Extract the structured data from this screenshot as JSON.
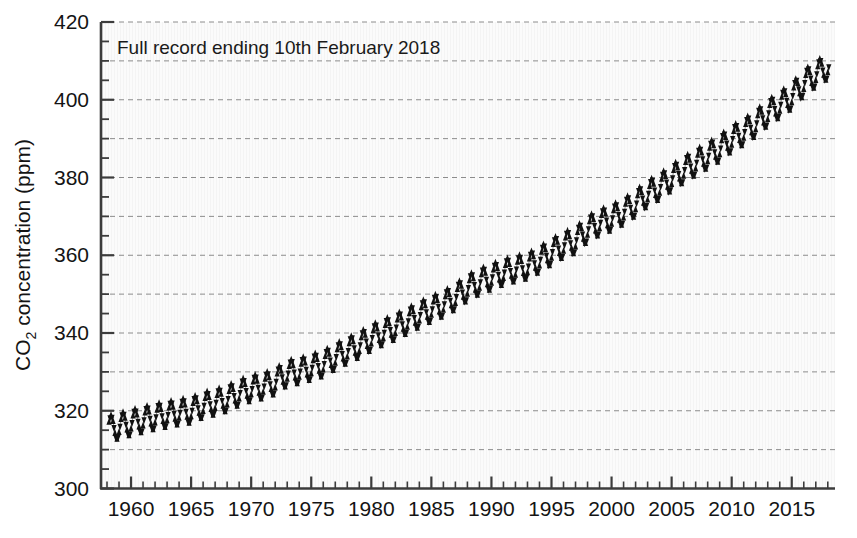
{
  "figure": {
    "background_color": "#ffffff",
    "plot_background_color": "#fbfbfb",
    "axis_color": "#3c3c3c",
    "grid_color": "#8c8c8c",
    "marker_color": "#111111"
  },
  "chart_data": {
    "type": "line",
    "title": "",
    "annotation": "Full record ending 10th February 2018",
    "xlabel": "",
    "ylabel_parts": {
      "pre": "CO",
      "sub": "2",
      "post": " concentration (ppm)"
    },
    "ylabel": "CO2 concentration (ppm)",
    "xlim": [
      1957.5,
      2018.6
    ],
    "ylim": [
      300,
      420
    ],
    "xticks_major": [
      1960,
      1965,
      1970,
      1975,
      1980,
      1985,
      1990,
      1995,
      2000,
      2005,
      2010,
      2015
    ],
    "xtick_labels": [
      "1960",
      "1965",
      "1970",
      "1975",
      "1980",
      "1985",
      "1990",
      "1995",
      "2000",
      "2005",
      "2010",
      "2015"
    ],
    "xtick_minor_step": 1,
    "yticks_major": [
      300,
      320,
      340,
      360,
      380,
      400,
      420
    ],
    "ytick_labels": [
      "300",
      "320",
      "340",
      "360",
      "380",
      "400",
      "420"
    ],
    "ytick_minor_step": 5,
    "gridlines_y": [
      310,
      320,
      330,
      340,
      350,
      360,
      370,
      380,
      390,
      400,
      410,
      420
    ],
    "grid": "horizontal-dashed",
    "legend": "none",
    "series": [
      {
        "name": "Mauna Loa monthly mean CO2 concentration",
        "marker": "triangle",
        "annual_mean": {
          "x": [
            1958,
            1959,
            1960,
            1961,
            1962,
            1963,
            1964,
            1965,
            1966,
            1967,
            1968,
            1969,
            1970,
            1971,
            1972,
            1973,
            1974,
            1975,
            1976,
            1977,
            1978,
            1979,
            1980,
            1981,
            1982,
            1983,
            1984,
            1985,
            1986,
            1987,
            1988,
            1989,
            1990,
            1991,
            1992,
            1993,
            1994,
            1995,
            1996,
            1997,
            1998,
            1999,
            2000,
            2001,
            2002,
            2003,
            2004,
            2005,
            2006,
            2007,
            2008,
            2009,
            2010,
            2011,
            2012,
            2013,
            2014,
            2015,
            2016,
            2017,
            2018
          ],
          "y": [
            315.3,
            315.98,
            316.91,
            317.64,
            318.45,
            318.99,
            319.62,
            320.04,
            321.38,
            322.16,
            323.04,
            324.62,
            325.68,
            326.32,
            327.45,
            329.68,
            330.18,
            331.11,
            332.04,
            333.83,
            335.4,
            336.84,
            338.75,
            340.11,
            341.45,
            343.05,
            344.65,
            346.12,
            347.42,
            349.19,
            351.57,
            353.12,
            354.39,
            355.61,
            356.45,
            357.1,
            358.83,
            360.82,
            362.61,
            363.73,
            366.7,
            368.38,
            369.55,
            371.14,
            373.28,
            375.8,
            377.52,
            379.8,
            381.9,
            383.79,
            385.6,
            387.43,
            389.9,
            391.65,
            393.85,
            396.52,
            398.65,
            400.83,
            404.24,
            406.55,
            408.5
          ]
        },
        "seasonal_amplitude_ppm": 6.4,
        "seasonal_peak_month": 5,
        "seasonal_trough_month": 9.5,
        "monthly_sampling": "monthly means, Mar 1958 - Feb 2018",
        "start_value_ppm": 315.3,
        "end_value_ppm": 408.5
      }
    ]
  }
}
